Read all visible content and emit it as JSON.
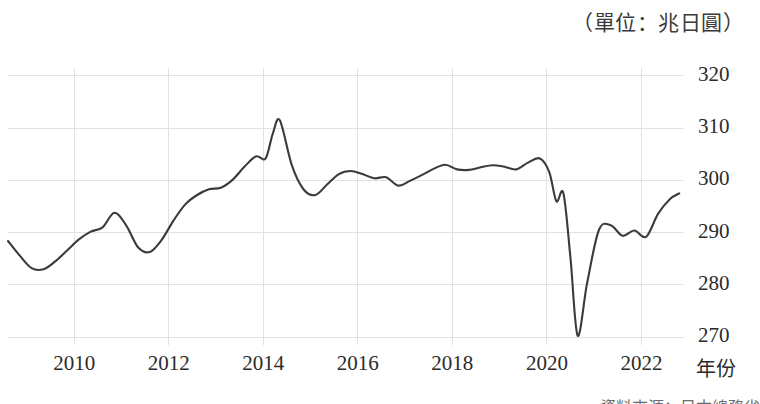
{
  "unit_label": "（單位：兆日圓）",
  "axis": {
    "x_title": "年份",
    "y_ticks": [
      "320",
      "310",
      "300",
      "290",
      "280",
      "270"
    ],
    "x_ticks": [
      "2010",
      "2012",
      "2014",
      "2016",
      "2018",
      "2020",
      "2022"
    ]
  },
  "source_note": "資料來源：日本總務省",
  "colors": {
    "line": "#3b3b3b",
    "grid": "#e2e2e2",
    "text": "#2b2b2b",
    "background": "#ffffff"
  },
  "chart_data": {
    "type": "line",
    "title": "",
    "subtitle": "",
    "xlabel": "年份",
    "ylabel": "（單位：兆日圓）",
    "xlim": [
      2008.6,
      2022.9
    ],
    "ylim": [
      268.5,
      321.5
    ],
    "grid": true,
    "legend": null,
    "x_tick_values": [
      2010,
      2012,
      2014,
      2016,
      2018,
      2020,
      2022
    ],
    "y_tick_values": [
      270,
      280,
      290,
      300,
      310,
      320
    ],
    "series": [
      {
        "name": "日本名目GDP",
        "x": [
          2008.6,
          2008.85,
          2009.1,
          2009.35,
          2009.6,
          2009.85,
          2010.1,
          2010.35,
          2010.6,
          2010.85,
          2011.1,
          2011.35,
          2011.6,
          2011.85,
          2012.1,
          2012.35,
          2012.6,
          2012.85,
          2013.1,
          2013.35,
          2013.6,
          2013.85,
          2014.05,
          2014.2,
          2014.35,
          2014.6,
          2014.85,
          2015.1,
          2015.35,
          2015.6,
          2015.85,
          2016.1,
          2016.35,
          2016.6,
          2016.85,
          2017.1,
          2017.35,
          2017.6,
          2017.85,
          2018.1,
          2018.35,
          2018.6,
          2018.85,
          2019.1,
          2019.35,
          2019.6,
          2019.85,
          2020.05,
          2020.2,
          2020.35,
          2020.5,
          2020.65,
          2020.85,
          2021.1,
          2021.35,
          2021.6,
          2021.85,
          2022.1,
          2022.35,
          2022.6,
          2022.8
        ],
        "y": [
          288.4,
          285.6,
          283.2,
          283.0,
          284.5,
          286.6,
          288.7,
          290.2,
          291.0,
          293.8,
          291.4,
          287.2,
          286.3,
          288.6,
          292.3,
          295.4,
          297.2,
          298.3,
          298.6,
          300.1,
          302.6,
          304.6,
          304.2,
          308.9,
          311.5,
          303.0,
          298.3,
          297.2,
          299.2,
          301.2,
          301.8,
          301.2,
          300.4,
          300.6,
          299.0,
          299.9,
          301.0,
          302.2,
          303.0,
          302.1,
          302.0,
          302.5,
          302.9,
          302.6,
          302.1,
          303.4,
          304.2,
          301.6,
          296.0,
          297.5,
          285.0,
          270.3,
          280.3,
          290.5,
          291.4,
          289.4,
          290.4,
          289.2,
          293.6,
          296.4,
          297.5
        ]
      }
    ]
  }
}
